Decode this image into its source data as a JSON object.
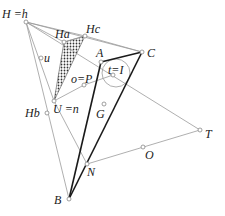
{
  "diagram": {
    "title": "",
    "points": [
      {
        "id": "H",
        "label": "H =h",
        "x": 26,
        "y": 22,
        "lx": 2,
        "ly": 18
      },
      {
        "id": "Ha",
        "label": "Ha",
        "x": 64,
        "y": 42,
        "lx": 55,
        "ly": 38
      },
      {
        "id": "Hc",
        "label": "Hc",
        "x": 85,
        "y": 36,
        "lx": 86,
        "ly": 33
      },
      {
        "id": "A",
        "label": "A",
        "x": 101,
        "y": 62,
        "lx": 96,
        "ly": 57
      },
      {
        "id": "C",
        "label": "C",
        "x": 142,
        "y": 52,
        "lx": 147,
        "ly": 57
      },
      {
        "id": "I",
        "label": "t=I",
        "x": 113,
        "y": 75,
        "lx": 108,
        "ly": 74
      },
      {
        "id": "P",
        "label": "o=P",
        "x": 84,
        "y": 85,
        "lx": 71,
        "ly": 83
      },
      {
        "id": "u",
        "label": "u",
        "x": 41,
        "y": 58,
        "lx": 44,
        "ly": 62
      },
      {
        "id": "U",
        "label": "U =n",
        "x": 54,
        "y": 101,
        "lx": 53,
        "ly": 113
      },
      {
        "id": "Hb",
        "label": "Hb",
        "x": 47,
        "y": 113,
        "lx": 25,
        "ly": 117
      },
      {
        "id": "G",
        "label": "G",
        "x": 104,
        "y": 104,
        "lx": 96,
        "ly": 118
      },
      {
        "id": "N",
        "label": "N",
        "x": 87,
        "y": 164,
        "lx": 87,
        "ly": 176
      },
      {
        "id": "O",
        "label": "O",
        "x": 143,
        "y": 147,
        "lx": 145,
        "ly": 159
      },
      {
        "id": "T",
        "label": "T",
        "x": 200,
        "y": 130,
        "lx": 205,
        "ly": 138
      },
      {
        "id": "B",
        "label": "B",
        "x": 69,
        "y": 199,
        "lx": 54,
        "ly": 204
      }
    ],
    "thick_segments": [
      [
        "A",
        "B"
      ],
      [
        "A",
        "C"
      ],
      [
        "C",
        "B"
      ]
    ],
    "thin_segments": [
      [
        "H",
        "Hc"
      ],
      [
        "H",
        "Ha"
      ],
      [
        "H",
        "C"
      ],
      [
        "H",
        "T"
      ],
      [
        "H",
        "B"
      ],
      [
        "H",
        "U"
      ],
      [
        "Ha",
        "Hc"
      ],
      [
        "Hc",
        "C"
      ],
      [
        "U",
        "N"
      ],
      [
        "U",
        "P"
      ],
      [
        "P",
        "I"
      ],
      [
        "N",
        "T"
      ]
    ],
    "hatched_triangle": [
      "Ha",
      "Hc",
      "U"
    ],
    "circle": {
      "cx": 116,
      "cy": 73,
      "r": 14
    },
    "colors": {
      "thick": "#1a1a1a",
      "thin": "#9a9a9a",
      "hatch": "#333333"
    }
  }
}
